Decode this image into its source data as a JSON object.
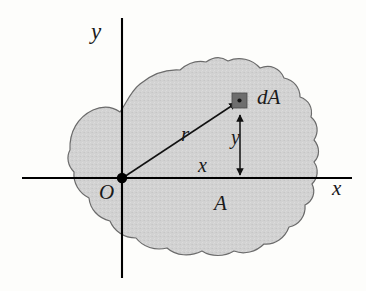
{
  "figure": {
    "type": "geometry-diagram",
    "background_color": "#fdfdfb"
  },
  "axes": {
    "x_label": "x",
    "y_label": "y",
    "origin_label": "O",
    "axis_color": "#000000",
    "x_axis": {
      "x_start": 22,
      "x_end": 352,
      "y": 178
    },
    "y_axis": {
      "y_start": 18,
      "y_end": 278,
      "x": 122
    },
    "origin_point": {
      "x": 122,
      "y": 178
    }
  },
  "labels": {
    "radius": "r",
    "distance_x": "x",
    "distance_y": "y",
    "area": "A",
    "element": "dA"
  },
  "element": {
    "name": "dA",
    "center": {
      "x": 240,
      "y": 100
    },
    "size": 15,
    "fill_color": "#6e6e6e",
    "dot_color": "#1a1a1a"
  },
  "region": {
    "name": "A",
    "fill_color": "#d2d2d2",
    "outline_color": "#6b6b6b"
  },
  "leaders": {
    "radius_line": {
      "from": {
        "x": 122,
        "y": 178
      },
      "to": {
        "x": 240,
        "y": 100
      }
    },
    "y_dimension": {
      "from": {
        "x": 240,
        "y": 178
      },
      "to": {
        "x": 240,
        "y": 100
      }
    }
  }
}
